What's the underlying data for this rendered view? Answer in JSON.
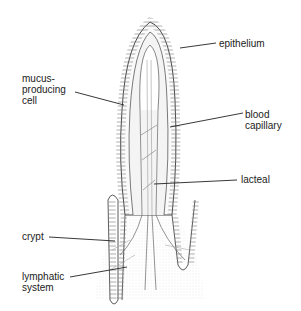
{
  "diagram": {
    "labels": [
      {
        "id": "epithelium",
        "text": "epithelium"
      },
      {
        "id": "mucus-producing-cell",
        "text": "mucus-\nproducing\ncell"
      },
      {
        "id": "blood-capillary",
        "text": "blood\ncapillary"
      },
      {
        "id": "lacteal",
        "text": "lacteal"
      },
      {
        "id": "crypt",
        "text": "crypt"
      },
      {
        "id": "lymphatic-system",
        "text": "lymphatic\nsystem"
      }
    ],
    "colors": {
      "line": "#333333",
      "fill": "#f2f2f2",
      "label": "#222222"
    }
  }
}
